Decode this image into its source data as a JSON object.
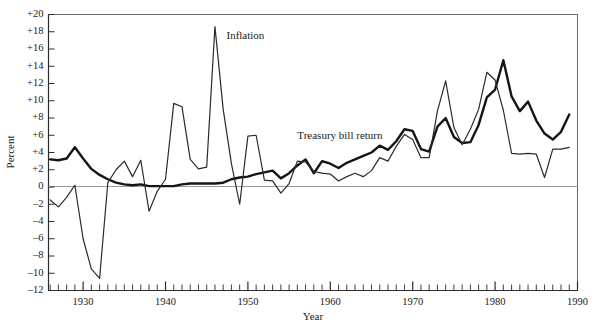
{
  "chart_data": {
    "type": "line",
    "title": "",
    "xlabel": "Year",
    "ylabel": "Percent",
    "xlim": [
      1925.8,
      1990.0
    ],
    "ylim": [
      -12,
      20
    ],
    "grid": false,
    "legend_position": "inline-annotations",
    "zero_line": true,
    "y_ticks": [
      "+20",
      "+18",
      "+16",
      "+14",
      "+12",
      "+10",
      "+8",
      "+6",
      "+4",
      "+2",
      "0",
      "–2",
      "–4",
      "–6",
      "–8",
      "–10",
      "–12"
    ],
    "y_tick_values": [
      20,
      18,
      16,
      14,
      12,
      10,
      8,
      6,
      4,
      2,
      0,
      -2,
      -4,
      -6,
      -8,
      -10,
      -12
    ],
    "x_ticks": [
      "1930",
      "1940",
      "1950",
      "1960",
      "1970",
      "1980",
      "1990"
    ],
    "x_tick_values": [
      1930,
      1940,
      1950,
      1960,
      1970,
      1980,
      1990
    ],
    "x_minor_tick_step": 1,
    "annotations": [
      {
        "text": "Inflation",
        "x": 1947.4,
        "y": 17.2
      },
      {
        "text": "Treasury bill return",
        "x": 1956.0,
        "y": 5.6
      }
    ],
    "x": [
      1926,
      1927,
      1928,
      1929,
      1930,
      1931,
      1932,
      1933,
      1934,
      1935,
      1936,
      1937,
      1938,
      1939,
      1940,
      1941,
      1942,
      1943,
      1944,
      1945,
      1946,
      1947,
      1948,
      1949,
      1950,
      1951,
      1952,
      1953,
      1954,
      1955,
      1956,
      1957,
      1958,
      1959,
      1960,
      1961,
      1962,
      1963,
      1964,
      1965,
      1966,
      1967,
      1968,
      1969,
      1970,
      1971,
      1972,
      1973,
      1974,
      1975,
      1976,
      1977,
      1978,
      1979,
      1980,
      1981,
      1982,
      1983,
      1984,
      1985,
      1986,
      1987,
      1988,
      1989
    ],
    "series": [
      {
        "name": "Treasury bill return",
        "color": "#151515",
        "width": 2.4,
        "values": [
          3.2,
          3.1,
          3.3,
          4.6,
          3.3,
          2.1,
          1.4,
          0.9,
          0.5,
          0.3,
          0.2,
          0.3,
          0.1,
          0.1,
          0.1,
          0.1,
          0.3,
          0.4,
          0.4,
          0.4,
          0.4,
          0.5,
          0.9,
          1.1,
          1.2,
          1.5,
          1.7,
          1.9,
          1.0,
          1.6,
          2.5,
          3.2,
          1.6,
          3.0,
          2.7,
          2.2,
          2.8,
          3.2,
          3.6,
          4.0,
          4.8,
          4.3,
          5.3,
          6.7,
          6.5,
          4.4,
          4.1,
          7.0,
          8.0,
          5.8,
          5.1,
          5.2,
          7.2,
          10.4,
          11.3,
          14.7,
          10.5,
          8.8,
          9.9,
          7.7,
          6.2,
          5.5,
          6.4,
          8.4
        ]
      },
      {
        "name": "Inflation",
        "color": "#2a2a2a",
        "width": 1.2,
        "values": [
          -1.5,
          -2.3,
          -1.2,
          0.2,
          -6.0,
          -9.5,
          -10.6,
          0.5,
          2.0,
          3.0,
          1.2,
          3.1,
          -2.8,
          -0.5,
          0.9,
          9.7,
          9.3,
          3.2,
          2.1,
          2.3,
          18.6,
          9.0,
          2.7,
          -2.0,
          5.9,
          6.0,
          0.8,
          0.7,
          -0.7,
          0.4,
          3.0,
          2.9,
          1.8,
          1.6,
          1.5,
          0.7,
          1.2,
          1.6,
          1.2,
          1.9,
          3.4,
          3.0,
          4.7,
          6.1,
          5.5,
          3.4,
          3.4,
          8.8,
          12.3,
          6.9,
          4.9,
          6.7,
          9.0,
          13.3,
          12.4,
          8.9,
          3.9,
          3.8,
          3.9,
          3.8,
          1.1,
          4.4,
          4.4,
          4.6
        ]
      }
    ]
  },
  "axes": {
    "y_axis_title": "Percent",
    "x_axis_title": "Year"
  }
}
